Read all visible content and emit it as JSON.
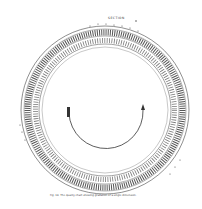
{
  "figure": {
    "header_label": "SECTION",
    "caption": "Fig. 18. The quality chart showing gradation of a single dimension.",
    "center_arrow": "clockwise-arc-arrow",
    "colors": {
      "ink": "#333333",
      "paper": "#ffffff"
    }
  }
}
